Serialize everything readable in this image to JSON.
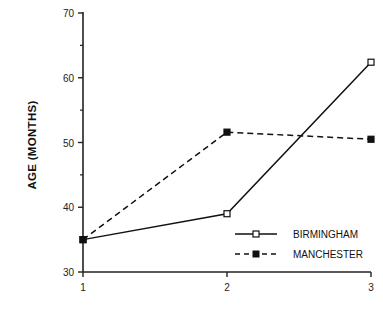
{
  "chart_data": {
    "type": "line",
    "title": "",
    "xlabel": "",
    "ylabel": "AGE  (MONTHS)",
    "x": [
      1,
      2,
      3
    ],
    "categories": [
      "1",
      "2",
      "3"
    ],
    "ylim": [
      30,
      70
    ],
    "yticks": [
      30,
      40,
      50,
      60,
      70
    ],
    "y_minor_ticks": [
      35,
      45,
      55,
      65
    ],
    "grid": false,
    "legend_position": "lower right (inside)",
    "series": [
      {
        "name": "BIRMINGHAM",
        "values": [
          35,
          39,
          62.4
        ],
        "line_style": "solid",
        "marker": "open-square",
        "color": "#111111"
      },
      {
        "name": "MANCHESTER",
        "values": [
          35,
          51.6,
          50.5
        ],
        "line_style": "dashed",
        "marker": "filled-square",
        "color": "#111111"
      }
    ]
  },
  "axis": {
    "y_title": "AGE  (MONTHS)",
    "y_tick_labels": [
      "70",
      "60",
      "50",
      "40",
      "30"
    ],
    "x_tick_labels": [
      "1",
      "2",
      "3"
    ]
  },
  "legend": {
    "items": [
      {
        "label": "BIRMINGHAM"
      },
      {
        "label": "MANCHESTER"
      }
    ]
  }
}
